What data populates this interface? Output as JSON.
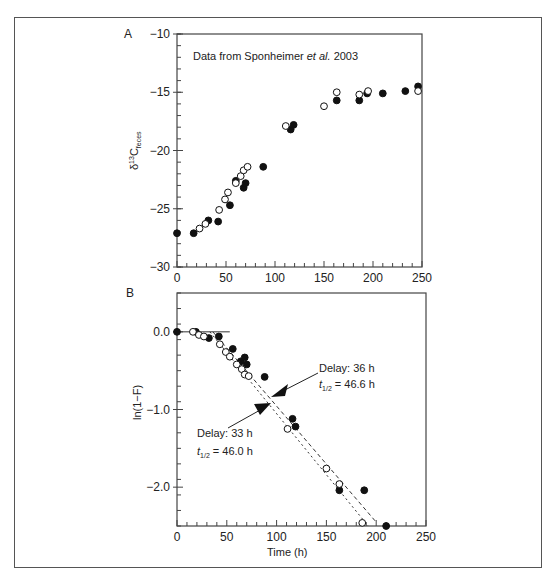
{
  "chart_data": [
    {
      "panel": "A",
      "type": "scatter",
      "annotation": "Data from Sponheimer et al. 2003",
      "xlabel": "",
      "ylabel": "δ13C feces",
      "xlim": [
        0,
        250
      ],
      "ylim": [
        -30,
        -10
      ],
      "xticks": [
        0,
        50,
        100,
        150,
        200,
        250
      ],
      "yticks": [
        -10,
        -15,
        -20,
        -25,
        -30
      ],
      "grid": false,
      "series": [
        {
          "name": "filled",
          "marker": "filled-circle",
          "points": [
            [
              0,
              -27.1
            ],
            [
              17,
              -27.1
            ],
            [
              32,
              -26.0
            ],
            [
              42,
              -26.1
            ],
            [
              54,
              -24.7
            ],
            [
              60,
              -22.6
            ],
            [
              68,
              -23.2
            ],
            [
              70,
              -22.8
            ],
            [
              88,
              -21.4
            ],
            [
              116,
              -18.2
            ],
            [
              119,
              -17.8
            ],
            [
              163,
              -15.7
            ],
            [
              186,
              -15.7
            ],
            [
              194,
              -15.1
            ],
            [
              210,
              -15.1
            ],
            [
              233,
              -14.9
            ],
            [
              246,
              -14.5
            ]
          ]
        },
        {
          "name": "open",
          "marker": "open-circle",
          "points": [
            [
              23,
              -26.7
            ],
            [
              29,
              -26.3
            ],
            [
              43,
              -25.1
            ],
            [
              49,
              -24.2
            ],
            [
              52,
              -23.6
            ],
            [
              60,
              -22.8
            ],
            [
              65,
              -22.2
            ],
            [
              68,
              -21.7
            ],
            [
              72,
              -21.4
            ],
            [
              111,
              -17.9
            ],
            [
              150,
              -16.2
            ],
            [
              163,
              -15.0
            ],
            [
              186,
              -15.2
            ],
            [
              195,
              -14.9
            ],
            [
              246,
              -14.9
            ]
          ]
        }
      ]
    },
    {
      "panel": "B",
      "type": "scatter",
      "xlabel": "Time (h)",
      "ylabel": "ln(1−F)",
      "xlim": [
        0,
        250
      ],
      "ylim": [
        -2.5,
        0.5
      ],
      "xticks": [
        0,
        50,
        100,
        150,
        200,
        250
      ],
      "yticks": [
        0.0,
        -1.0,
        -2.0
      ],
      "grid": false,
      "series": [
        {
          "name": "filled",
          "marker": "filled-circle",
          "points": [
            [
              0,
              0.0
            ],
            [
              19,
              0.0
            ],
            [
              32,
              -0.08
            ],
            [
              42,
              -0.06
            ],
            [
              56,
              -0.22
            ],
            [
              64,
              -0.38
            ],
            [
              68,
              -0.33
            ],
            [
              70,
              -0.42
            ],
            [
              88,
              -0.58
            ],
            [
              116,
              -1.12
            ],
            [
              119,
              -1.22
            ],
            [
              163,
              -2.04
            ],
            [
              188,
              -2.04
            ],
            [
              210,
              -2.5
            ]
          ]
        },
        {
          "name": "open",
          "marker": "open-circle",
          "points": [
            [
              16,
              0.0
            ],
            [
              22,
              -0.04
            ],
            [
              27,
              -0.06
            ],
            [
              43,
              -0.16
            ],
            [
              49,
              -0.26
            ],
            [
              53,
              -0.32
            ],
            [
              60,
              -0.42
            ],
            [
              65,
              -0.48
            ],
            [
              68,
              -0.55
            ],
            [
              72,
              -0.57
            ],
            [
              111,
              -1.25
            ],
            [
              150,
              -1.76
            ],
            [
              163,
              -1.96
            ],
            [
              186,
              -2.46
            ]
          ]
        }
      ],
      "fit_lines": [
        {
          "style": "solid",
          "from": [
            0,
            0.0
          ],
          "to": [
            53,
            0.0
          ]
        },
        {
          "style": "dashed",
          "label": "Delay: 36 h",
          "half_life": "t1/2 = 46.6 h",
          "from": [
            36,
            0.0
          ],
          "to": [
            200,
            -2.45
          ]
        },
        {
          "style": "dotted",
          "label": "Delay: 33 h",
          "half_life": "t1/2 = 46.0 h",
          "from": [
            33,
            0.0
          ],
          "to": [
            192,
            -2.5
          ]
        }
      ],
      "annotations": [
        {
          "line1": "Delay:  36 h",
          "line2_prefix": "t",
          "line2_sub": "1/2",
          "line2_suffix": " = 46.6 h"
        },
        {
          "line1": "Delay:  33 h",
          "line2_prefix": "t",
          "line2_sub": "1/2",
          "line2_suffix": " = 46.0 h"
        }
      ]
    }
  ],
  "labels": {
    "panel_a": "A",
    "panel_b": "B",
    "a_note_prefix": "Data from Sponheimer ",
    "a_note_italic": "et al.",
    "a_note_suffix": " 2003",
    "a_ylabel_delta": "δ",
    "a_ylabel_sup": "13",
    "a_ylabel_c": "C",
    "a_ylabel_sub": "feces",
    "b_ylabel": "ln(1−F)",
    "b_xlabel": "Time (h)",
    "b_ann1_line1": "Delay:  36 h",
    "b_ann1_t": "t",
    "b_ann1_sub": "1/2",
    "b_ann1_val": " = 46.6 h",
    "b_ann2_line1": "Delay:  33 h",
    "b_ann2_t": "t",
    "b_ann2_sub": "1/2",
    "b_ann2_val": " = 46.0 h"
  }
}
